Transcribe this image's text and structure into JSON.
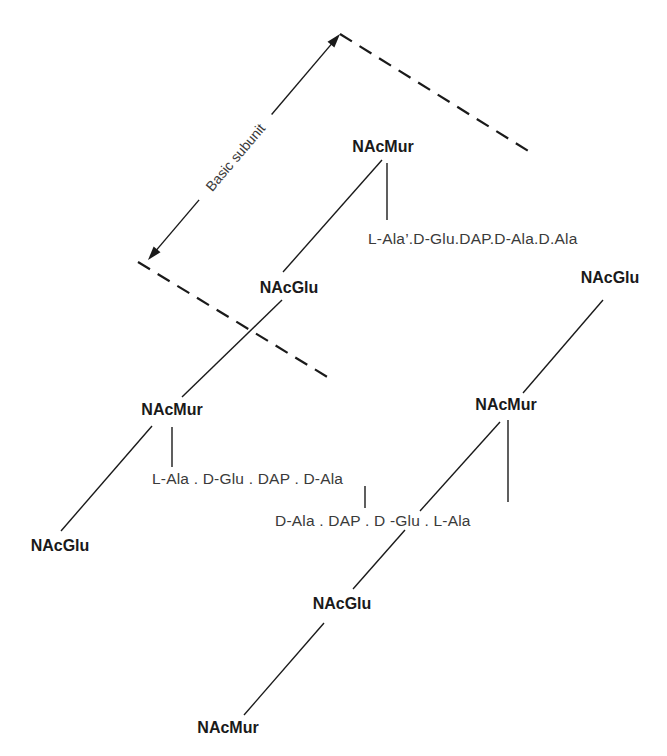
{
  "diagram": {
    "colors": {
      "background": "#ffffff",
      "ink": "#1a1a1a",
      "peptide_ink": "#3a3a3a"
    },
    "dimension": {
      "label": "Basic subunit",
      "from": [
        148,
        260
      ],
      "to": [
        340,
        34
      ]
    },
    "boundaries": [
      {
        "name": "upper",
        "from": [
          340,
          34
        ],
        "to": [
          530,
          152
        ]
      },
      {
        "name": "lower",
        "from": [
          138,
          262
        ],
        "to": [
          334,
          381
        ]
      }
    ],
    "sugars": {
      "top_murNAc": {
        "label": "NAcMur",
        "x": 383,
        "y": 152
      },
      "center_glcNAc": {
        "label": "NAcGlu",
        "x": 289,
        "y": 293
      },
      "left_murNAc": {
        "label": "NAcMur",
        "x": 172,
        "y": 415
      },
      "left_glcNAc": {
        "label": "NAcGlu",
        "x": 60,
        "y": 551
      },
      "right_glcNAc": {
        "label": "NAcGlu",
        "x": 610,
        "y": 283
      },
      "right_murNAc": {
        "label": "NAcMur",
        "x": 506,
        "y": 410
      },
      "bottom_glcNAc": {
        "label": "NAcGlu",
        "x": 342,
        "y": 609
      },
      "bottom_murNAc": {
        "label": "NAcMur",
        "x": 228,
        "y": 733
      }
    },
    "peptides": {
      "top_chain": {
        "text": "L-Ala’.D-Glu.DAP.D-Ala.D.Ala",
        "x": 368,
        "y": 244
      },
      "left_chain": {
        "text": "L-Ala . D-Glu . DAP . D-Ala",
        "x": 152,
        "y": 484
      },
      "right_chain": {
        "text": "D-Ala . DAP . D -Glu . L-Ala",
        "x": 275,
        "y": 526
      }
    },
    "bonds": [
      {
        "name": "top-murNAc-to-center-glcNAc",
        "from": [
          382,
          160
        ],
        "to": [
          283,
          272
        ]
      },
      {
        "name": "top-murNAc-to-peptide",
        "from": [
          387,
          163
        ],
        "to": [
          387,
          220
        ]
      },
      {
        "name": "center-glcNAc-to-left-murNAc",
        "from": [
          282,
          300
        ],
        "to": [
          182,
          397
        ]
      },
      {
        "name": "left-murNAc-to-left-glcNAc",
        "from": [
          152,
          426
        ],
        "to": [
          61,
          531
        ]
      },
      {
        "name": "left-murNAc-to-peptide",
        "from": [
          172,
          427
        ],
        "to": [
          172,
          467
        ]
      },
      {
        "name": "peptide-cross-link",
        "from": [
          365,
          486
        ],
        "to": [
          365,
          508
        ]
      },
      {
        "name": "right-glcNAc-to-right-murNAc",
        "from": [
          603,
          300
        ],
        "to": [
          523,
          393
        ]
      },
      {
        "name": "right-murNAc-to-glcNAc-upper",
        "from": [
          500,
          422
        ],
        "to": [
          420,
          511
        ]
      },
      {
        "name": "right-murNAc-to-glcNAc-lower",
        "from": [
          405,
          530
        ],
        "to": [
          353,
          589
        ]
      },
      {
        "name": "right-murNAc-to-peptide",
        "from": [
          508,
          420
        ],
        "to": [
          508,
          502
        ]
      },
      {
        "name": "bottom-glcNAc-to-bottom-murNAc",
        "from": [
          324,
          623
        ],
        "to": [
          244,
          715
        ]
      }
    ]
  }
}
